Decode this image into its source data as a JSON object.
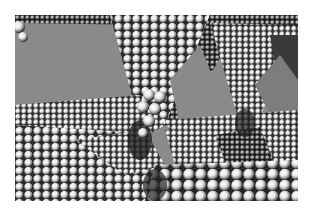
{
  "image": {
    "description": "Grayscale 3D rendering of close-packed spheres forming inverted pyramidal cavities and faceted crystal surfaces",
    "background_color": "#ffffff",
    "wall_color": "#8a8a8a",
    "sphere_highlight": "#ffffff",
    "sphere_shadow": "#1a1a1a",
    "bounds": {
      "x": 15,
      "y": 15,
      "width": 283,
      "height": 186
    }
  }
}
